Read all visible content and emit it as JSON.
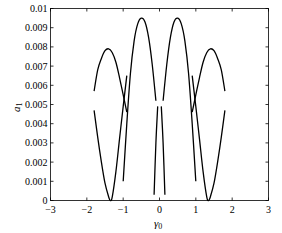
{
  "chart_data": {
    "type": "line",
    "title": "",
    "xlabel": "γ0",
    "xlabel_main": "γ",
    "xlabel_sub": "0",
    "ylabel": "a1",
    "ylabel_main": "a",
    "ylabel_sub": "1",
    "xlim": [
      -3,
      3
    ],
    "ylim": [
      0,
      0.01
    ],
    "grid": false,
    "legend": null,
    "x_ticks": [
      -3,
      -2,
      -1,
      0,
      1,
      2,
      3
    ],
    "x_tick_labels": [
      "−3",
      "−2",
      "−1",
      "0",
      "1",
      "2",
      "3"
    ],
    "y_ticks": [
      0,
      0.001,
      0.002,
      0.003,
      0.004,
      0.005,
      0.006,
      0.007,
      0.008,
      0.009,
      0.01
    ],
    "y_tick_labels": [
      "0",
      "0.001",
      "0.002",
      "0.003",
      "0.004",
      "0.005",
      "0.006",
      "0.007",
      "0.008",
      "0.009",
      "0.01"
    ],
    "series": [
      {
        "name": "upper-left-arch",
        "x": [
          -1.8,
          -1.7,
          -1.6,
          -1.5,
          -1.4,
          -1.3,
          -1.2,
          -1.1,
          -1.0,
          -0.9
        ],
        "y": [
          0.0057,
          0.0068,
          0.0074,
          0.0078,
          0.0079,
          0.0077,
          0.0072,
          0.0064,
          0.0055,
          0.0046
        ]
      },
      {
        "name": "lower-left-v",
        "x": [
          -1.8,
          -1.7,
          -1.6,
          -1.5,
          -1.4,
          -1.35,
          -1.3,
          -1.2,
          -1.1,
          -1.0,
          -0.9
        ],
        "y": [
          0.0047,
          0.0033,
          0.002,
          0.0009,
          0.0002,
          0.0,
          0.0002,
          0.0015,
          0.0032,
          0.0049,
          0.0065
        ]
      },
      {
        "name": "upper-center-left-arch",
        "x": [
          -1.0,
          -0.9,
          -0.8,
          -0.7,
          -0.6,
          -0.5,
          -0.4,
          -0.3,
          -0.2,
          -0.1
        ],
        "y": [
          0.001,
          0.004,
          0.0066,
          0.0083,
          0.0092,
          0.0095,
          0.0093,
          0.0085,
          0.0071,
          0.0052
        ]
      },
      {
        "name": "lower-center-left",
        "x": [
          -0.15,
          -0.1,
          -0.05
        ],
        "y": [
          0.0003,
          0.003,
          0.0049
        ]
      },
      {
        "name": "upper-center-right-arch",
        "x": [
          0.1,
          0.2,
          0.3,
          0.4,
          0.5,
          0.6,
          0.7,
          0.8,
          0.9,
          1.0
        ],
        "y": [
          0.0052,
          0.0071,
          0.0085,
          0.0093,
          0.0095,
          0.0092,
          0.0083,
          0.0066,
          0.004,
          0.001
        ]
      },
      {
        "name": "lower-center-right",
        "x": [
          0.05,
          0.1,
          0.15
        ],
        "y": [
          0.0049,
          0.003,
          0.0003
        ]
      },
      {
        "name": "upper-right-arch",
        "x": [
          0.9,
          1.0,
          1.1,
          1.2,
          1.3,
          1.4,
          1.5,
          1.6,
          1.7,
          1.8
        ],
        "y": [
          0.0046,
          0.0055,
          0.0064,
          0.0072,
          0.0077,
          0.0079,
          0.0078,
          0.0074,
          0.0068,
          0.0057
        ]
      },
      {
        "name": "lower-right-v",
        "x": [
          0.9,
          1.0,
          1.1,
          1.2,
          1.3,
          1.35,
          1.4,
          1.5,
          1.6,
          1.7,
          1.8
        ],
        "y": [
          0.0065,
          0.0049,
          0.0032,
          0.0015,
          0.0002,
          0.0,
          0.0002,
          0.0009,
          0.002,
          0.0033,
          0.0047
        ]
      }
    ]
  }
}
